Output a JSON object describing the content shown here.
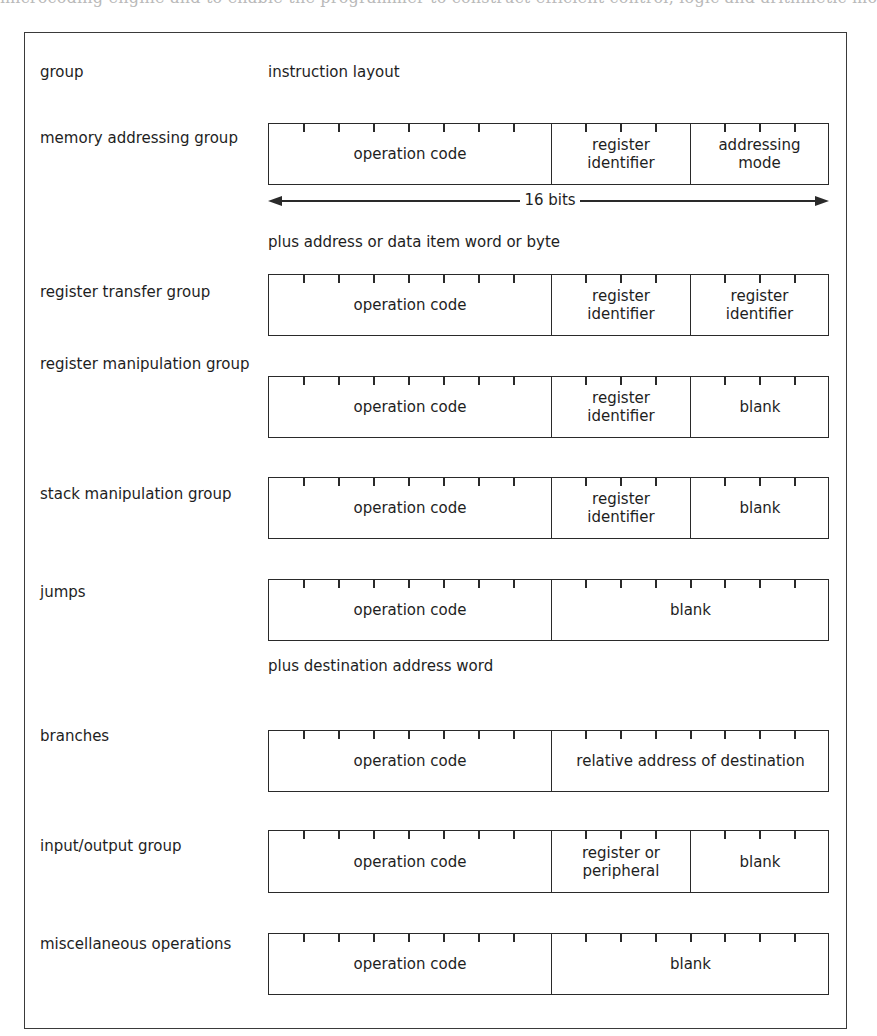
{
  "background_text": "microcoding engine and to enable the programmer to construct efficient control, logic and arithmetic mo",
  "figure": {
    "header": {
      "group_col": "group",
      "layout_col": "instruction layout"
    },
    "word_width": {
      "label": "16 bits",
      "bits": 16
    },
    "rows": [
      {
        "group": "memory addressing group",
        "fields": [
          {
            "label": "operation code",
            "bits": 8
          },
          {
            "label": "register identifier",
            "bits": 4
          },
          {
            "label": "addressing mode",
            "bits": 4
          }
        ],
        "note": "plus address or data item word or byte"
      },
      {
        "group": "register transfer group",
        "fields": [
          {
            "label": "operation code",
            "bits": 8
          },
          {
            "label": "register identifier",
            "bits": 4
          },
          {
            "label": "register identifier",
            "bits": 4
          }
        ]
      },
      {
        "group": "register manipulation group",
        "fields": [
          {
            "label": "operation code",
            "bits": 8
          },
          {
            "label": "register identifier",
            "bits": 4
          },
          {
            "label": "blank",
            "bits": 4
          }
        ]
      },
      {
        "group": "stack manipulation group",
        "fields": [
          {
            "label": "operation code",
            "bits": 8
          },
          {
            "label": "register identifier",
            "bits": 4
          },
          {
            "label": "blank",
            "bits": 4
          }
        ]
      },
      {
        "group": "jumps",
        "fields": [
          {
            "label": "operation code",
            "bits": 8
          },
          {
            "label": "blank",
            "bits": 8
          }
        ],
        "note": "plus destination address word"
      },
      {
        "group": "branches",
        "fields": [
          {
            "label": "operation code",
            "bits": 8
          },
          {
            "label": "relative address of destination",
            "bits": 8
          }
        ]
      },
      {
        "group": "input/output group",
        "fields": [
          {
            "label": "operation code",
            "bits": 8
          },
          {
            "label": "register or peripheral",
            "bits": 4
          },
          {
            "label": "blank",
            "bits": 4
          }
        ]
      },
      {
        "group": "miscellaneous operations",
        "fields": [
          {
            "label": "operation code",
            "bits": 8
          },
          {
            "label": "blank",
            "bits": 8
          }
        ]
      }
    ]
  }
}
